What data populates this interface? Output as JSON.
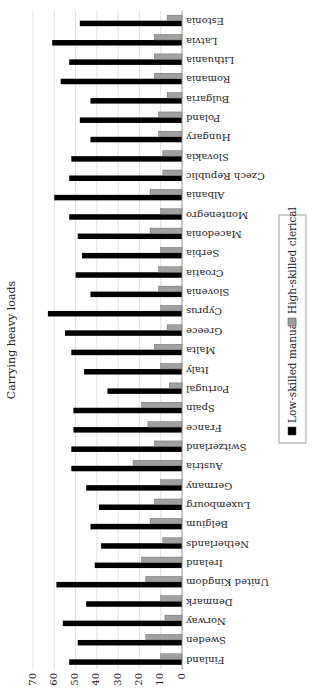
{
  "chart_data": {
    "type": "bar",
    "orientation": "vertical (figure rotated 90° counter-clockwise on page)",
    "title": "Carrying heavy loads",
    "xlabel": "",
    "ylabel": "",
    "ylim": [
      0,
      70
    ],
    "yticks": [
      "0",
      "10",
      "20",
      "30",
      "40",
      "50",
      "60",
      "70"
    ],
    "grid": true,
    "legend_position": "bottom",
    "categories": [
      "Finland",
      "Sweden",
      "Norway",
      "Denmark",
      "United Kingdom",
      "Ireland",
      "Netherlands",
      "Belgium",
      "Luxembourg",
      "Germany",
      "Austria",
      "Switzerland",
      "France",
      "Spain",
      "Portugal",
      "Italy",
      "Malta",
      "Greece",
      "Cyprus",
      "Slovenia",
      "Croatia",
      "Serbia",
      "Macedonia",
      "Montenegro",
      "Albania",
      "Czech Republic",
      "Slovakia",
      "Hungary",
      "Poland",
      "Bulgaria",
      "Romania",
      "Lithuania",
      "Latvia",
      "Estonia"
    ],
    "series": [
      {
        "name": "Low-skilled manual",
        "color": "#000000",
        "values": [
          53,
          49,
          56,
          45,
          59,
          41,
          38,
          43,
          39,
          45,
          52,
          52,
          51,
          51,
          35,
          46,
          52,
          55,
          63,
          43,
          50,
          47,
          49,
          53,
          60,
          53,
          52,
          43,
          48,
          43,
          57,
          53,
          61,
          48
        ]
      },
      {
        "name": "High-skilled clerical",
        "color": "#a0a0a0",
        "values": [
          10,
          17,
          8,
          10,
          17,
          19,
          9,
          15,
          13,
          10,
          23,
          13,
          16,
          19,
          6,
          10,
          13,
          7,
          10,
          11,
          11,
          10,
          15,
          10,
          15,
          9,
          9,
          11,
          11,
          7,
          13,
          13,
          13,
          7
        ]
      }
    ]
  }
}
